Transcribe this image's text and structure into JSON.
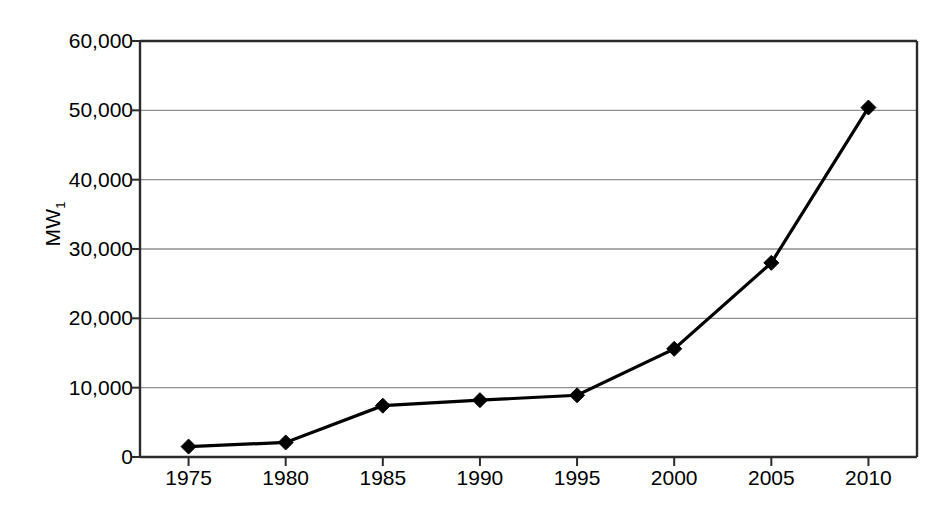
{
  "chart_data": {
    "type": "line",
    "title": "",
    "xlabel": "",
    "ylabel": "MW",
    "ylabel_subscript": "1",
    "categories": [
      1975,
      1980,
      1985,
      1990,
      1995,
      2000,
      2005,
      2010
    ],
    "x_tick_labels": [
      "1975",
      "1980",
      "1985",
      "1990",
      "1995",
      "2000",
      "2005",
      "2010"
    ],
    "y_tick_labels": [
      "0",
      "10,000",
      "20,000",
      "30,000",
      "40,000",
      "50,000",
      "60,000"
    ],
    "y_tick_values": [
      0,
      10000,
      20000,
      30000,
      40000,
      50000,
      60000
    ],
    "values": [
      1500,
      2100,
      7400,
      8200,
      8900,
      15600,
      28000,
      50400
    ],
    "series": [
      {
        "name": "MW1",
        "values": [
          1500,
          2100,
          7400,
          8200,
          8900,
          15600,
          28000,
          50400
        ]
      }
    ],
    "xlim": [
      1972.5,
      2012.5
    ],
    "ylim": [
      0,
      60000
    ],
    "grid": "horizontal",
    "legend": "none",
    "marker": "diamond",
    "line_color": "#000000",
    "marker_color": "#000000",
    "grid_color": "#8f8f8f",
    "axis_color": "#2b2b2b",
    "background_color": "#ffffff"
  }
}
